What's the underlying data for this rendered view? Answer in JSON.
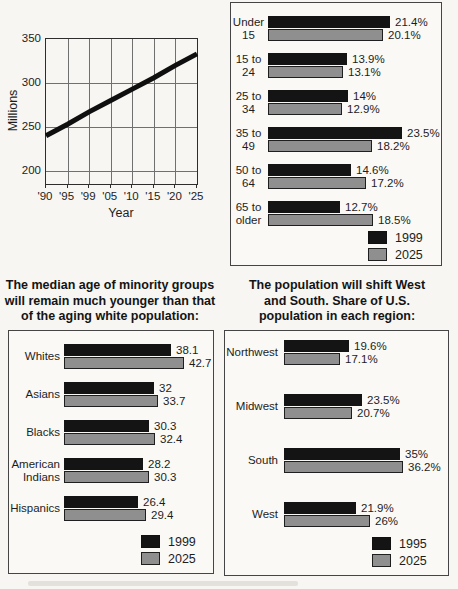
{
  "colors": {
    "bar_dark": "#141414",
    "bar_gray": "#8f8f8f",
    "box_border": "#454545",
    "background": "#f7f6f2",
    "text": "#1d1d1d"
  },
  "chart_data": [
    {
      "id": "us-population-line",
      "type": "line",
      "ylabel": "Millions",
      "xlabel": "Year",
      "x_ticks": [
        "'90",
        "'95",
        "'99",
        "'05",
        "'10",
        "'15",
        "'20",
        "'25"
      ],
      "y_ticks": [
        350,
        300,
        250,
        200
      ],
      "ylim": [
        185,
        350
      ],
      "grid": true,
      "series": [
        {
          "values": [
            240,
            253,
            267,
            280,
            293,
            306,
            320,
            333
          ]
        }
      ]
    },
    {
      "id": "age-group-share",
      "type": "bar",
      "orientation": "horizontal",
      "unit": "%",
      "categories": [
        [
          "Under",
          "15"
        ],
        [
          "15 to",
          "24"
        ],
        [
          "25 to",
          "34"
        ],
        [
          "35 to",
          "49"
        ],
        [
          "50 to",
          "64"
        ],
        [
          "65 to",
          "older"
        ]
      ],
      "series": [
        {
          "name": "1999",
          "color": "#141414",
          "values": [
            21.4,
            13.9,
            14,
            23.5,
            14.6,
            12.7
          ],
          "labels": [
            "21.4%",
            "13.9%",
            "14%",
            "23.5%",
            "14.6%",
            "12.7%"
          ]
        },
        {
          "name": "2025",
          "color": "#8f8f8f",
          "border": "#1f1f1f",
          "values": [
            20.1,
            13.1,
            12.9,
            18.2,
            17.2,
            18.5
          ],
          "labels": [
            "20.1%",
            "13.1%",
            "12.9%",
            "18.2%",
            "17.2%",
            "18.5%"
          ]
        }
      ],
      "legend": [
        "1999",
        "2025"
      ],
      "legend_position": "bottom-right",
      "xlim": [
        0,
        25
      ]
    },
    {
      "id": "median-age-by-group",
      "type": "bar",
      "orientation": "horizontal",
      "title": "The median age of minority groups will remain much younger than that of the aging white population:",
      "title_lines": [
        "The median age of minority groups",
        "will remain much younger than that",
        "of the aging white population:"
      ],
      "categories": [
        [
          "Whites"
        ],
        [
          "Asians"
        ],
        [
          "Blacks"
        ],
        [
          "American",
          "Indians"
        ],
        [
          "Hispanics"
        ]
      ],
      "series": [
        {
          "name": "1999",
          "color": "#141414",
          "values": [
            38.1,
            32,
            30.3,
            28.2,
            26.4
          ],
          "labels": [
            "38.1",
            "32",
            "30.3",
            "28.2",
            "26.4"
          ]
        },
        {
          "name": "2025",
          "color": "#8f8f8f",
          "border": "#1f1f1f",
          "values": [
            42.7,
            33.7,
            32.4,
            30.3,
            29.4
          ],
          "labels": [
            "42.7",
            "33.7",
            "32.4",
            "30.3",
            "29.4"
          ]
        }
      ],
      "legend": [
        "1999",
        "2025"
      ],
      "legend_position": "bottom-right",
      "xlim": [
        0,
        45
      ]
    },
    {
      "id": "region-share",
      "type": "bar",
      "orientation": "horizontal",
      "unit": "%",
      "title": "The population will shift West and South. Share of U.S. population in each region:",
      "title_lines": [
        "The population will shift West",
        "and South. Share of U.S.",
        "population in each region:"
      ],
      "categories": [
        [
          "Northwest"
        ],
        [
          "Midwest"
        ],
        [
          "South"
        ],
        [
          "West"
        ]
      ],
      "series": [
        {
          "name": "1995",
          "color": "#141414",
          "values": [
            19.6,
            23.5,
            35,
            21.9
          ],
          "labels": [
            "19.6%",
            "23.5%",
            "35%",
            "21.9%"
          ]
        },
        {
          "name": "2025",
          "color": "#8f8f8f",
          "border": "#1f1f1f",
          "values": [
            17.1,
            20.7,
            36.2,
            26
          ],
          "labels": [
            "17.1%",
            "20.7%",
            "36.2%",
            "26%"
          ]
        }
      ],
      "legend": [
        "1995",
        "2025"
      ],
      "legend_position": "bottom-right",
      "xlim": [
        0,
        40
      ]
    }
  ]
}
